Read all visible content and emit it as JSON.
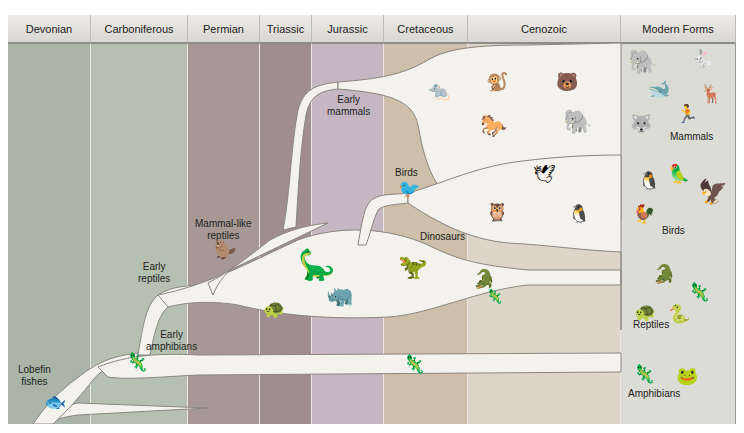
{
  "periods": [
    {
      "name": "Devonian",
      "color": "#aab5a8"
    },
    {
      "name": "Carboniferous",
      "color": "#b6c0b0"
    },
    {
      "name": "Permian",
      "color": "#a79896"
    },
    {
      "name": "Triassic",
      "color": "#9f8e8d"
    },
    {
      "name": "Jurassic",
      "color": "#c6b6c1"
    },
    {
      "name": "Cretaceous",
      "color": "#cdbfa9"
    },
    {
      "name": "Cenozoic",
      "color": "#ddd5c7"
    },
    {
      "name": "Modern Forms",
      "color": "#dcdcd6"
    }
  ],
  "lineages": {
    "lobefin": "Lobefin fishes",
    "early_amphibians_1": "Early",
    "early_amphibians_2": "amphibians",
    "early_reptiles_1": "Early",
    "early_reptiles_2": "reptiles",
    "mammal_like_1": "Mammal-like",
    "mammal_like_2": "reptiles",
    "early_mammals_1": "Early",
    "early_mammals_2": "mammals",
    "birds": "Birds",
    "dinosaurs": "Dinosaurs",
    "lobefin_1": "Lobefin",
    "lobefin_2": "fishes"
  },
  "modern_forms": {
    "mammals": "Mammals",
    "birds": "Birds",
    "reptiles": "Reptiles",
    "amphibians": "Amphibians"
  },
  "colors": {
    "branch": "#f4f2ec",
    "branch_edge": "#8a8680",
    "header_text": "#222222"
  }
}
